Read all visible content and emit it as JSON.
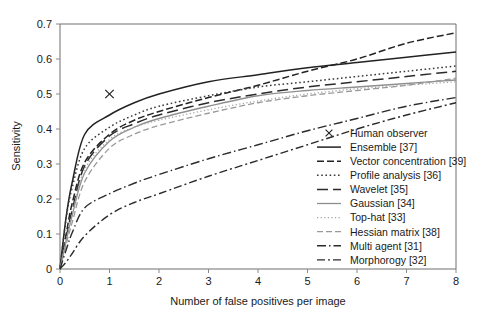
{
  "chart_data": {
    "type": "line",
    "title": "",
    "xlabel": "Number of false positives per image",
    "ylabel": "Sensitivity",
    "xlim": [
      0,
      8
    ],
    "ylim": [
      0,
      0.7
    ],
    "xticks": [
      "0",
      "1",
      "2",
      "3",
      "4",
      "5",
      "6",
      "7",
      "8"
    ],
    "yticks": [
      "0",
      "0.1",
      "0.2",
      "0.3",
      "0.4",
      "0.5",
      "0.6",
      "0.7"
    ],
    "grid": false,
    "legend_position": "inside-bottom-right",
    "x": [
      0,
      0.125,
      0.25,
      0.5,
      1,
      1.5,
      2,
      3,
      4,
      5,
      6,
      7,
      8
    ],
    "series": [
      {
        "name": "Ensemble [37]",
        "label": "Ensemble [37]",
        "style": "solid",
        "color": "#222222",
        "width": 1.5,
        "dash": "none",
        "values": [
          0.0,
          0.15,
          0.25,
          0.385,
          0.44,
          0.475,
          0.5,
          0.535,
          0.555,
          0.575,
          0.59,
          0.605,
          0.62
        ]
      },
      {
        "name": "Vector concentration [39]",
        "label": "Vector concentration [39]",
        "style": "dashed",
        "color": "#222222",
        "width": 1.5,
        "dash": "7,3",
        "values": [
          0.0,
          0.1,
          0.19,
          0.305,
          0.385,
          0.425,
          0.45,
          0.49,
          0.525,
          0.565,
          0.6,
          0.645,
          0.675
        ]
      },
      {
        "name": "Profile analysis [36]",
        "label": "Profile analysis [36]",
        "style": "dotted",
        "color": "#3a3a3a",
        "width": 1.5,
        "dash": "1.6,2.6",
        "values": [
          0.0,
          0.145,
          0.235,
          0.345,
          0.405,
          0.44,
          0.465,
          0.495,
          0.52,
          0.535,
          0.55,
          0.565,
          0.58
        ]
      },
      {
        "name": "Wavelet [35]",
        "label": "Wavelet [35]",
        "style": "long-dashed",
        "color": "#2b2b2b",
        "width": 1.5,
        "dash": "11,5",
        "values": [
          0.0,
          0.09,
          0.17,
          0.295,
          0.38,
          0.415,
          0.44,
          0.475,
          0.5,
          0.52,
          0.535,
          0.55,
          0.565
        ]
      },
      {
        "name": "Gaussian [34]",
        "label": "Gaussian [34]",
        "style": "solid-gray",
        "color": "#8f8f8f",
        "width": 1.3,
        "dash": "none",
        "values": [
          0.0,
          0.08,
          0.155,
          0.275,
          0.365,
          0.405,
          0.43,
          0.465,
          0.495,
          0.51,
          0.52,
          0.53,
          0.54
        ]
      },
      {
        "name": "Top-hat [33]",
        "label": "Top-hat [33]",
        "style": "fine-dotted",
        "color": "#a3a3a3",
        "width": 1.3,
        "dash": "1.2,2.4",
        "values": [
          0.0,
          0.085,
          0.16,
          0.285,
          0.37,
          0.405,
          0.425,
          0.455,
          0.48,
          0.5,
          0.515,
          0.525,
          0.535
        ]
      },
      {
        "name": "Hessian matrix [38]",
        "label": "Hessian matrix [38]",
        "style": "gray-dashed",
        "color": "#9a9a9a",
        "width": 1.3,
        "dash": "6,3",
        "values": [
          0.0,
          0.07,
          0.135,
          0.25,
          0.345,
          0.385,
          0.41,
          0.445,
          0.475,
          0.495,
          0.51,
          0.525,
          0.545
        ]
      },
      {
        "name": "Multi agent [31]",
        "label": "Multi agent [31]",
        "style": "dash-dot",
        "color": "#2b2b2b",
        "width": 1.4,
        "dash": "9,3,1.5,3",
        "values": [
          0.0,
          0.055,
          0.105,
          0.175,
          0.215,
          0.245,
          0.27,
          0.315,
          0.355,
          0.395,
          0.43,
          0.465,
          0.49
        ]
      },
      {
        "name": "Morphorogy [32]",
        "label": "Morphorogy [32]",
        "style": "dash-dot-long",
        "color": "#2b2b2b",
        "width": 1.4,
        "dash": "8,3,2,3",
        "values": [
          0.0,
          0.02,
          0.045,
          0.095,
          0.155,
          0.19,
          0.215,
          0.265,
          0.31,
          0.355,
          0.4,
          0.44,
          0.475
        ]
      }
    ],
    "markers": [
      {
        "name": "Human observer",
        "label": "Human observer",
        "symbol": "x",
        "color": "#222222",
        "x": 1.0,
        "y": 0.5
      }
    ],
    "legend": [
      {
        "label": "Human observer",
        "swatch": "marker-x"
      },
      {
        "label": "Ensemble [37]",
        "swatch": "solid"
      },
      {
        "label": "Vector concentration [39]",
        "swatch": "dashed"
      },
      {
        "label": "Profile analysis [36]",
        "swatch": "dotted"
      },
      {
        "label": "Wavelet [35]",
        "swatch": "long-dashed"
      },
      {
        "label": "Gaussian [34]",
        "swatch": "solid-gray"
      },
      {
        "label": "Top-hat [33]",
        "swatch": "fine-dotted"
      },
      {
        "label": "Hessian matrix [38]",
        "swatch": "gray-dashed"
      },
      {
        "label": "Multi agent [31]",
        "swatch": "dash-dot"
      },
      {
        "label": "Morphorogy [32]",
        "swatch": "dash-dot-long"
      }
    ]
  }
}
